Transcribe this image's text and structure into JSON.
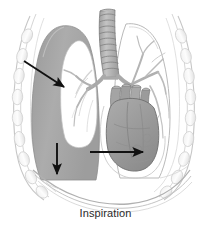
{
  "figure": {
    "caption": "Inspiration",
    "title": "Inspiration",
    "view": "anterior-coronal-section",
    "colors": {
      "background": "#ffffff",
      "lung_shaded_fill": "#a8a8a8",
      "lung_shaded_fill_dark": "#949494",
      "lung_air_cavity": "#ffffff",
      "heart_fill": "#9c9c9c",
      "heart_outline": "#6e6e6e",
      "trachea_fill": "#b4b4b4",
      "trachea_outline": "#7a7a7a",
      "bronchi_fill": "#b0b0b0",
      "ribcage_stroke": "#c9c9c9",
      "ribcage_fill": "#fbfbfb",
      "diaphragm_stroke": "#b5b5b5",
      "arrow_color": "#111111",
      "caption_color": "#2b2b2b",
      "outline_stroke": "#8f8f8f"
    },
    "structures": [
      {
        "name": "trachea",
        "label": "Trachea",
        "description": "cartilage-ring tube descending from top center"
      },
      {
        "name": "left-bronchus",
        "label": "Left main bronchus",
        "description": "branch into shaded lung"
      },
      {
        "name": "right-bronchus",
        "label": "Right main bronchus",
        "description": "branch into outlined lung"
      },
      {
        "name": "bronchial-tree",
        "label": "Bronchial tree",
        "description": "branching airways in both lungs"
      },
      {
        "name": "left-lung-shaded",
        "label": "Lung (expanded, shaded)",
        "description": "gray filled lung on viewer left"
      },
      {
        "name": "right-lung-outline",
        "label": "Lung (outlined)",
        "description": "white lung on viewer right"
      },
      {
        "name": "lung-air-cavity",
        "label": "Air-filled lung cavity",
        "description": "white interior of shaded lung"
      },
      {
        "name": "heart",
        "label": "Heart",
        "description": "central organ with great vessels above"
      },
      {
        "name": "great-vessels",
        "label": "Great vessels",
        "description": "aorta and pulmonary arteries above heart"
      },
      {
        "name": "ribcage",
        "label": "Rib cage",
        "description": "segmented ribs forming thoracic wall"
      },
      {
        "name": "diaphragm",
        "label": "Diaphragm",
        "description": "downward-curving dome at base of thorax"
      }
    ],
    "arrows": [
      {
        "name": "chest-expansion-arrow",
        "direction": "down-right",
        "meaning": "chest wall moves outward and upward during inspiration",
        "from": [
          24,
          61
        ],
        "to": [
          67,
          89
        ]
      },
      {
        "name": "lung-expansion-arrow",
        "direction": "down",
        "meaning": "lung base descends as thoracic volume increases",
        "from": [
          57,
          143
        ],
        "to": [
          57,
          177
        ]
      },
      {
        "name": "diaphragm-contraction-arrow",
        "direction": "right",
        "meaning": "thoracic cavity widens as diaphragm contracts",
        "from": [
          90,
          152
        ],
        "to": [
          146,
          152
        ]
      }
    ]
  }
}
